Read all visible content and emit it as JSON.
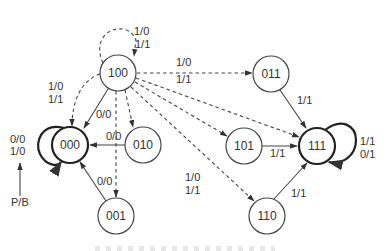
{
  "diagram": {
    "type": "state-transition",
    "colors": {
      "stroke": "#444444",
      "text": "#333333",
      "background": "#ffffff"
    },
    "states": [
      {
        "id": "s000",
        "label": "000",
        "x": 70,
        "y": 145,
        "r": 18,
        "bold": true
      },
      {
        "id": "s001",
        "label": "001",
        "x": 116,
        "y": 216,
        "r": 18,
        "bold": false
      },
      {
        "id": "s010",
        "label": "010",
        "x": 143,
        "y": 145,
        "r": 18,
        "bold": false
      },
      {
        "id": "s011",
        "label": "011",
        "x": 271,
        "y": 74,
        "r": 18,
        "bold": false
      },
      {
        "id": "s100",
        "label": "100",
        "x": 118,
        "y": 73,
        "r": 18,
        "bold": false
      },
      {
        "id": "s101",
        "label": "101",
        "x": 244,
        "y": 146,
        "r": 18,
        "bold": false
      },
      {
        "id": "s110",
        "label": "110",
        "x": 267,
        "y": 216,
        "r": 18,
        "bold": false
      },
      {
        "id": "s111",
        "label": "111",
        "x": 317,
        "y": 146,
        "r": 18,
        "bold": true
      }
    ],
    "transitions": [
      {
        "from": "100",
        "to": "100",
        "style": "dashed",
        "labels": [
          "1/0",
          "1/1"
        ]
      },
      {
        "from": "100",
        "to": "000",
        "style": "dashed",
        "labels": [
          "1/0",
          "1/1"
        ]
      },
      {
        "from": "100",
        "to": "000",
        "style": "solid",
        "labels": [
          "0/0"
        ]
      },
      {
        "from": "100",
        "to": "010",
        "style": "dashed",
        "labels": []
      },
      {
        "from": "100",
        "to": "001",
        "style": "dashed",
        "labels": []
      },
      {
        "from": "100",
        "to": "011",
        "style": "dashed",
        "labels": [
          "1/0",
          "1/1"
        ]
      },
      {
        "from": "100",
        "to": "101",
        "style": "dashed",
        "labels": []
      },
      {
        "from": "100",
        "to": "111",
        "style": "dashed",
        "labels": []
      },
      {
        "from": "100",
        "to": "110",
        "style": "dashed",
        "labels": [
          "1/0",
          "1/1"
        ]
      },
      {
        "from": "010",
        "to": "000",
        "style": "solid",
        "labels": [
          "0/0"
        ]
      },
      {
        "from": "001",
        "to": "000",
        "style": "solid",
        "labels": [
          "0/0"
        ]
      },
      {
        "from": "000",
        "to": "000",
        "style": "bold",
        "labels": [
          "0/0",
          "1/0"
        ]
      },
      {
        "from": "011",
        "to": "111",
        "style": "solid",
        "labels": [
          "1/1"
        ]
      },
      {
        "from": "101",
        "to": "111",
        "style": "solid",
        "labels": [
          "1/1"
        ]
      },
      {
        "from": "110",
        "to": "111",
        "style": "solid",
        "labels": [
          "1/1"
        ]
      },
      {
        "from": "111",
        "to": "111",
        "style": "bold",
        "labels": [
          "1/1",
          "0/1"
        ]
      }
    ],
    "annotations": {
      "self_loop_100": [
        "1/0",
        "1/1"
      ],
      "edge_100_000": [
        "1/0",
        "1/1"
      ],
      "edge_100_000_solid": "0/0",
      "edge_100_011": [
        "1/0",
        "1/1"
      ],
      "edge_100_110": [
        "1/0",
        "1/1"
      ],
      "edge_010_000": "0/0",
      "edge_001_000": "0/0",
      "self_loop_000": [
        "0/0",
        "1/0"
      ],
      "edge_011_111": "1/1",
      "edge_101_111": "1/1",
      "edge_110_111": "1/1",
      "self_loop_111": [
        "1/1",
        "0/1"
      ],
      "pointer_label": "P/B"
    }
  }
}
